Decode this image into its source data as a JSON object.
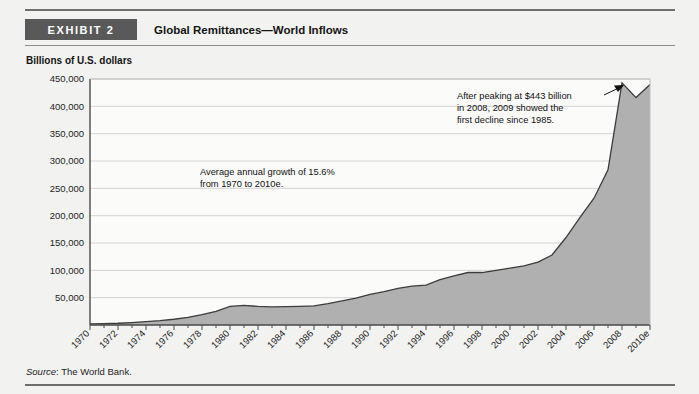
{
  "header": {
    "exhibit_tag": "EXHIBIT 2",
    "title": "Global Remittances—World Inflows"
  },
  "y_axis_caption": "Billions of U.S. dollars",
  "source": {
    "label": "Source",
    "separator": ": ",
    "text": "The World Bank."
  },
  "annotations": {
    "growth": {
      "line1": "Average annual growth of 15.6%",
      "line2": "from 1970 to 2010e."
    },
    "peak": {
      "line1": "After peaking at $443 billion",
      "line2": "in 2008, 2009 showed the",
      "line3": "first decline since 1985."
    }
  },
  "colors": {
    "area_fill": "#b0b0b0",
    "area_stroke": "#3c3c3c",
    "grid": "#d3d3d3",
    "axis": "#4a4a4a",
    "tag_bg": "#595959",
    "plot_bg": "#fbfbfa"
  },
  "chart_data": {
    "type": "area",
    "title": "Global Remittances—World Inflows",
    "xlabel": "",
    "ylabel": "Billions of U.S. dollars",
    "ylim": [
      0,
      450000
    ],
    "xlim": [
      "1970",
      "2010e"
    ],
    "grid": true,
    "legend": "none",
    "ytick_labels": [
      "50,000",
      "100,000",
      "150,000",
      "200,000",
      "250,000",
      "300,000",
      "350,000",
      "400,000",
      "450,000"
    ],
    "ytick_values": [
      50000,
      100000,
      150000,
      200000,
      250000,
      300000,
      350000,
      400000,
      450000
    ],
    "xtick_labels": [
      "1970",
      "1972",
      "1974",
      "1976",
      "1978",
      "1980",
      "1982",
      "1984",
      "1986",
      "1988",
      "1990",
      "1992",
      "1994",
      "1996",
      "1998",
      "2000",
      "2002",
      "2004",
      "2006",
      "2008",
      "2010e"
    ],
    "categories": [
      "1970",
      "1971",
      "1972",
      "1973",
      "1974",
      "1975",
      "1976",
      "1977",
      "1978",
      "1979",
      "1980",
      "1981",
      "1982",
      "1983",
      "1984",
      "1985",
      "1986",
      "1987",
      "1988",
      "1989",
      "1990",
      "1991",
      "1992",
      "1993",
      "1994",
      "1995",
      "1996",
      "1997",
      "1998",
      "1999",
      "2000",
      "2001",
      "2002",
      "2003",
      "2004",
      "2005",
      "2006",
      "2007",
      "2008",
      "2009",
      "2010e"
    ],
    "values": [
      2000,
      2500,
      3200,
      4500,
      6200,
      8000,
      10500,
      14000,
      19000,
      25000,
      34000,
      36000,
      34000,
      33000,
      33500,
      34000,
      35000,
      39000,
      44000,
      49000,
      56000,
      61000,
      67000,
      71000,
      73000,
      83000,
      90000,
      96000,
      96000,
      100000,
      104000,
      108000,
      115000,
      128000,
      160000,
      197000,
      232000,
      284000,
      443000,
      416000,
      440000
    ],
    "annotations": [
      {
        "text": "Average annual growth of 15.6% from 1970 to 2010e.",
        "x": "1982",
        "y": 270000
      },
      {
        "text": "After peaking at $443 billion in 2008, 2009 showed the first decline since 1985.",
        "x": "2001",
        "y": 420000,
        "points_to": {
          "x": "2008",
          "y": 443000
        }
      }
    ]
  }
}
